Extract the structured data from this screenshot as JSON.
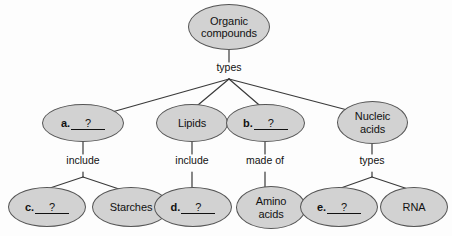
{
  "diagram": {
    "colors": {
      "node_fill": "#d2d2d2",
      "node_border": "#555555",
      "edge": "#3a3a3a",
      "text": "#111111",
      "background": "#fdfdfd"
    },
    "nodes": [
      {
        "id": "root",
        "label": "Organic\ncompounds",
        "kind": "text"
      },
      {
        "id": "a",
        "letter": "a.",
        "question": "?",
        "kind": "blank"
      },
      {
        "id": "lipids",
        "label": "Lipids",
        "kind": "text"
      },
      {
        "id": "b",
        "letter": "b.",
        "question": "?",
        "kind": "blank"
      },
      {
        "id": "nucleic",
        "label": "Nucleic\nacids",
        "kind": "text"
      },
      {
        "id": "c",
        "letter": "c.",
        "question": "?",
        "kind": "blank"
      },
      {
        "id": "starches",
        "label": "Starches",
        "kind": "text"
      },
      {
        "id": "d",
        "letter": "d.",
        "question": "?",
        "kind": "blank"
      },
      {
        "id": "amino",
        "label": "Amino\nacids",
        "kind": "text"
      },
      {
        "id": "e",
        "letter": "e.",
        "question": "?",
        "kind": "blank"
      },
      {
        "id": "rna",
        "label": "RNA",
        "kind": "text"
      }
    ],
    "edge_labels": [
      {
        "id": "root-types",
        "label": "types"
      },
      {
        "id": "a-include",
        "label": "include"
      },
      {
        "id": "lipids-include",
        "label": "include"
      },
      {
        "id": "b-madeof",
        "label": "made of"
      },
      {
        "id": "nucleic-types",
        "label": "types"
      }
    ]
  }
}
